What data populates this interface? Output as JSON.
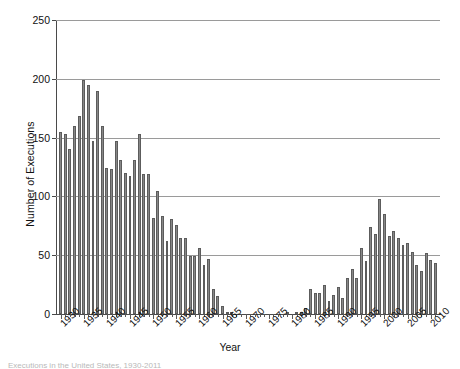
{
  "chart_data": {
    "type": "bar",
    "title": "",
    "xlabel": "Year",
    "ylabel": "Number of Executions",
    "ylim": [
      0,
      250
    ],
    "yticks": [
      0,
      50,
      100,
      150,
      200,
      250
    ],
    "xticks": [
      1930,
      1935,
      1940,
      1945,
      1950,
      1955,
      1960,
      1965,
      1970,
      1975,
      1980,
      1985,
      1990,
      1995,
      2000,
      2005,
      2010
    ],
    "grid": "horizontal",
    "legend": "none",
    "categories": [
      1930,
      1931,
      1932,
      1933,
      1934,
      1935,
      1936,
      1937,
      1938,
      1939,
      1940,
      1941,
      1942,
      1943,
      1944,
      1945,
      1946,
      1947,
      1948,
      1949,
      1950,
      1951,
      1952,
      1953,
      1954,
      1955,
      1956,
      1957,
      1958,
      1959,
      1960,
      1961,
      1962,
      1963,
      1964,
      1965,
      1966,
      1967,
      1968,
      1969,
      1970,
      1971,
      1972,
      1973,
      1974,
      1975,
      1976,
      1977,
      1978,
      1979,
      1980,
      1981,
      1982,
      1983,
      1984,
      1985,
      1986,
      1987,
      1988,
      1989,
      1990,
      1991,
      1992,
      1993,
      1994,
      1995,
      1996,
      1997,
      1998,
      1999,
      2000,
      2001,
      2002,
      2003,
      2004,
      2005,
      2006,
      2007,
      2008,
      2009,
      2010,
      2011
    ],
    "values": [
      155,
      153,
      140,
      160,
      168,
      199,
      195,
      147,
      190,
      160,
      124,
      123,
      147,
      131,
      120,
      117,
      131,
      153,
      119,
      119,
      82,
      105,
      83,
      62,
      81,
      76,
      65,
      65,
      49,
      49,
      56,
      42,
      47,
      21,
      15,
      7,
      1,
      2,
      0,
      0,
      0,
      0,
      0,
      0,
      0,
      0,
      0,
      0,
      0,
      2,
      0,
      1,
      2,
      5,
      21,
      18,
      18,
      25,
      11,
      16,
      23,
      14,
      31,
      38,
      31,
      56,
      45,
      74,
      68,
      98,
      85,
      66,
      71,
      65,
      59,
      60,
      53,
      42,
      37,
      52,
      46,
      43
    ],
    "series_name": "Executions"
  },
  "axes": {
    "ytick_labels": [
      "0",
      "50",
      "100",
      "150",
      "200",
      "250"
    ],
    "xtick_labels": [
      "1930",
      "1935",
      "1940",
      "1945",
      "1950",
      "1955",
      "1960",
      "1965",
      "1970",
      "1975",
      "1980",
      "1985",
      "1990",
      "1995",
      "2000",
      "2005",
      "2010"
    ],
    "ylabel": "Number of Executions",
    "xlabel": "Year"
  },
  "caption": "Executions in the United States, 1930-2011",
  "colors": {
    "bar_fill": "#7f7f7f",
    "bar_edge": "#5c5c5c",
    "gridline": "#9a9a9a",
    "axis": "#4a4a4a",
    "text": "#111111",
    "background": "#ffffff"
  }
}
